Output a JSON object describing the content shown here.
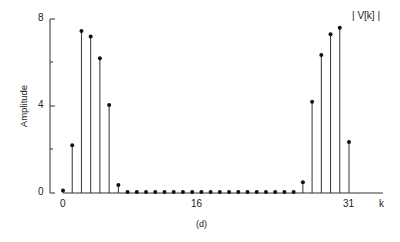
{
  "chart_data": {
    "type": "stem",
    "title": "",
    "series_label": "| V[k] |",
    "caption": "(d)",
    "xlabel": "k",
    "ylabel": "Amplitude",
    "x_ticks": [
      "0",
      "16",
      "31"
    ],
    "y_ticks": [
      "0",
      "4",
      "8"
    ],
    "y_minor_ticks": [
      2,
      6
    ],
    "xlim": [
      0,
      31
    ],
    "ylim": [
      0,
      8
    ],
    "grid": false,
    "x": [
      0,
      1,
      2,
      3,
      4,
      5,
      6,
      7,
      8,
      9,
      10,
      11,
      12,
      13,
      14,
      15,
      16,
      17,
      18,
      19,
      20,
      21,
      22,
      23,
      24,
      25,
      26,
      27,
      28,
      29,
      30,
      31
    ],
    "values": [
      0.12,
      2.2,
      7.45,
      7.2,
      6.2,
      4.05,
      0.37,
      0.05,
      0.05,
      0.05,
      0.05,
      0.05,
      0.05,
      0.05,
      0.05,
      0.05,
      0.05,
      0.05,
      0.05,
      0.05,
      0.05,
      0.05,
      0.05,
      0.05,
      0.05,
      0.05,
      0.5,
      4.2,
      6.35,
      7.3,
      7.6,
      2.35
    ]
  },
  "labels": {
    "y_tick_8": "8",
    "y_tick_4": "4",
    "y_tick_0": "0",
    "x_tick_0": "0",
    "x_tick_16": "16",
    "x_tick_31": "31",
    "x_axis": "k",
    "y_axis": "Amplitude",
    "legend": "| V[k] |",
    "caption": "(d)"
  }
}
